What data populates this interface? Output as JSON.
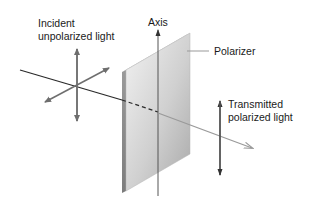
{
  "diagram": {
    "labels": {
      "incident_line1": "Incident",
      "incident_line2": "unpolarized light",
      "axis": "Axis",
      "polarizer": "Polarizer",
      "transmitted_line1": "Transmitted",
      "transmitted_line2": "polarized light"
    },
    "colors": {
      "beam_incident": "#2a2a2a",
      "beam_transmitted": "#9a9a9a",
      "arrows": "#6e6e6e",
      "polarizer_light": "#e8e8e8",
      "polarizer_dark": "#a8a8a8",
      "axis_line": "#555555"
    }
  }
}
